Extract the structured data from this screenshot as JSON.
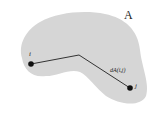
{
  "diagram": {
    "region_label": "A",
    "point_i_label": "i",
    "point_j_label": "j",
    "distance_label": "dA(i,j)",
    "region_color": "#d6d6d6",
    "line_color": "#333333",
    "point_color": "#111111"
  }
}
